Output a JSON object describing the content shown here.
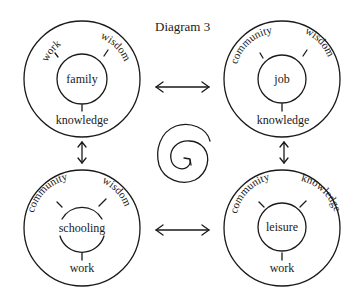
{
  "title": "Diagram 3",
  "colors": {
    "ink": "#1a1a1a",
    "background": "#ffffff"
  },
  "nodes": [
    {
      "id": "family",
      "center": "family",
      "labels": {
        "upper_left": "work",
        "upper_right": "wisdom",
        "bottom": "knowledge"
      }
    },
    {
      "id": "job",
      "center": "job",
      "labels": {
        "upper_left": "community",
        "upper_right": "wisdom",
        "bottom": "knowledge"
      }
    },
    {
      "id": "schooling",
      "center": "schooling",
      "labels": {
        "upper_left": "community",
        "upper_right": "wisdom",
        "bottom": "work"
      }
    },
    {
      "id": "leisure",
      "center": "leisure",
      "labels": {
        "upper_left": "community",
        "upper_right": "knowledge",
        "bottom": "work"
      }
    }
  ],
  "connectors": [
    {
      "from": "family",
      "to": "job",
      "type": "bidirectional-arrow"
    },
    {
      "from": "schooling",
      "to": "leisure",
      "type": "bidirectional-arrow"
    },
    {
      "from": "family",
      "to": "schooling",
      "type": "bidirectional-arrow"
    },
    {
      "from": "job",
      "to": "leisure",
      "type": "bidirectional-arrow"
    }
  ],
  "center_symbol": "spiral-icon"
}
